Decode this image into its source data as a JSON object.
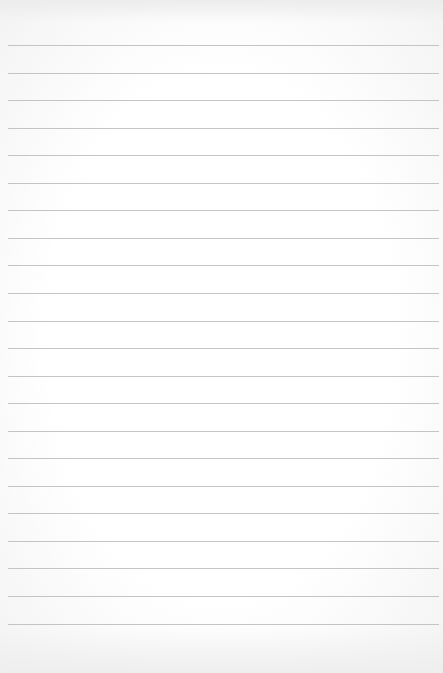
{
  "page": {
    "type": "blank-ruled-paper",
    "background_color": "#fbfbfb",
    "line_color": "#c4c4c4",
    "line_count": 22,
    "first_line_y": 45,
    "line_spacing": 27.55,
    "line_left": 8,
    "line_right": 439
  }
}
